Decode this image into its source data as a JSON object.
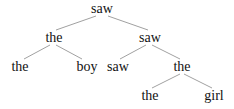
{
  "tree": {
    "nodes": [
      {
        "id": "n0",
        "label": "saw",
        "x": 102,
        "y": 1
      },
      {
        "id": "n1",
        "label": "the",
        "x": 54,
        "y": 30
      },
      {
        "id": "n2",
        "label": "saw",
        "x": 150,
        "y": 30
      },
      {
        "id": "n3",
        "label": "the",
        "x": 20,
        "y": 59
      },
      {
        "id": "n4",
        "label": "boy",
        "x": 87,
        "y": 59
      },
      {
        "id": "n5",
        "label": "saw",
        "x": 118,
        "y": 59
      },
      {
        "id": "n6",
        "label": "the",
        "x": 182,
        "y": 59
      },
      {
        "id": "n7",
        "label": "the",
        "x": 150,
        "y": 88
      },
      {
        "id": "n8",
        "label": "girl",
        "x": 214,
        "y": 88
      }
    ],
    "edges": [
      [
        "n0",
        "n1"
      ],
      [
        "n0",
        "n2"
      ],
      [
        "n1",
        "n3"
      ],
      [
        "n1",
        "n4"
      ],
      [
        "n2",
        "n5"
      ],
      [
        "n2",
        "n6"
      ],
      [
        "n6",
        "n7"
      ],
      [
        "n6",
        "n8"
      ]
    ]
  }
}
